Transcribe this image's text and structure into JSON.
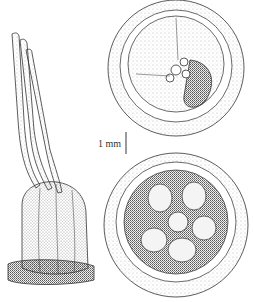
{
  "figure": {
    "type": "botanical stipple illustration",
    "panels": [
      {
        "id": "side-view",
        "description": "fruit with long styles, side view"
      },
      {
        "id": "top-view-upper",
        "description": "fruit viewed from above, partially opened"
      },
      {
        "id": "top-view-lower",
        "description": "fruit viewed from above, showing stellate interior"
      }
    ],
    "scale_bar": {
      "label": "1 mm"
    },
    "colors": {
      "ink": "#2a2a2a",
      "paper": "#ffffff",
      "scale_bar": "#9a9a9a"
    }
  }
}
